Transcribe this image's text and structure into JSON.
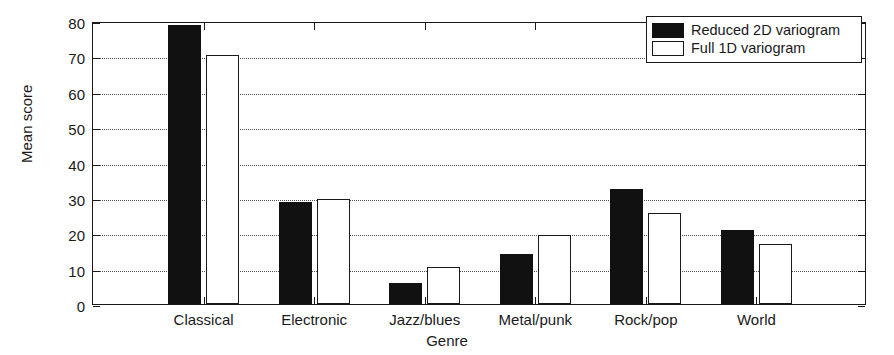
{
  "chart_data": {
    "type": "bar",
    "title": "",
    "xlabel": "Genre",
    "ylabel": "Mean score",
    "categories": [
      "Classical",
      "Electronic",
      "Jazz/blues",
      "Metal/punk",
      "Rock/pop",
      "World"
    ],
    "series": [
      {
        "name": "Reduced 2D variogram",
        "color": "#111111",
        "values": [
          79.0,
          28.8,
          6.0,
          14.0,
          32.5,
          21.0
        ]
      },
      {
        "name": "Full 1D variogram",
        "color": "#ffffff",
        "values": [
          70.5,
          29.6,
          10.5,
          19.4,
          25.6,
          17.0
        ]
      }
    ],
    "ylim": [
      0,
      80
    ],
    "yticks": [
      0,
      10,
      20,
      30,
      40,
      50,
      60,
      70,
      80
    ],
    "ytick_labels": [
      "0",
      "10",
      "20",
      "30",
      "40",
      "50",
      "60",
      "70",
      "80"
    ],
    "grid": "horizontal-dotted",
    "legend_position": "top-right",
    "legend_entries": [
      "Reduced 2D variogram",
      "Full 1D variogram"
    ]
  }
}
